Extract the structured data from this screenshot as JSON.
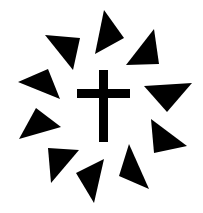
{
  "image": {
    "width": 203,
    "height": 213,
    "background": "#ffffff",
    "foreground": "#000000",
    "description": "Black Christian cross surrounded by ten black triangles arranged in a ring"
  },
  "cross": {
    "vertical_bar": {
      "x": 99,
      "y": 70,
      "width": 9,
      "height": 72
    },
    "horizontal_bar": {
      "x": 77,
      "y": 89,
      "width": 53,
      "height": 9
    }
  },
  "triangles": [
    {
      "name": "triangle-upper-left",
      "points": "45,35 80,38 73,70"
    },
    {
      "name": "triangle-top",
      "points": "104,10 124,38 95,54"
    },
    {
      "name": "triangle-upper-right",
      "points": "154,29 159,64 126,65"
    },
    {
      "name": "triangle-right",
      "points": "144,86 192,83 167,112"
    },
    {
      "name": "triangle-lower-right",
      "points": "151,119 187,146 154,153"
    },
    {
      "name": "triangle-bottom-right",
      "points": "129,144 149,189 119,176"
    },
    {
      "name": "triangle-bottom",
      "points": "76,173 104,159 94,203"
    },
    {
      "name": "triangle-bottom-left",
      "points": "48,148 79,150 51,183"
    },
    {
      "name": "triangle-lower-left",
      "points": "36,108 61,127 19,139"
    },
    {
      "name": "triangle-left",
      "points": "18,82 48,69 60,99"
    }
  ]
}
